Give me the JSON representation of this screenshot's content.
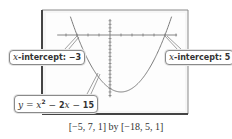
{
  "chart_data": {
    "type": "line",
    "title": "",
    "function": "y = x^2 - 2x - 15",
    "series": [
      {
        "name": "y = x² − 2x − 15",
        "x": [
          -5,
          -4,
          -3,
          -2,
          -1,
          0,
          1,
          2,
          3,
          4,
          5,
          6,
          7
        ],
        "y": [
          20,
          9,
          0,
          -7,
          -12,
          -15,
          -16,
          -15,
          -12,
          -7,
          0,
          9,
          20
        ]
      }
    ],
    "xlim": [
      -5,
      7
    ],
    "ylim": [
      -18,
      5
    ],
    "xscale": 1,
    "yscale": 1,
    "grid": false,
    "annotations": [
      {
        "text": "x-intercept: −3",
        "x": -3,
        "y": 0
      },
      {
        "text": "x-intercept: 5",
        "x": 5,
        "y": 0
      },
      {
        "text": "y = x² − 2x − 15",
        "target": "curve"
      }
    ],
    "xlabel": "",
    "ylabel": ""
  },
  "labels": {
    "left_intercept_var": "x",
    "left_intercept_text": "-intercept: ",
    "left_intercept_value": "−3",
    "right_intercept_var": "x",
    "right_intercept_text": "-intercept: ",
    "right_intercept_value": "5",
    "equation_y": "y",
    "equation_eq": " = ",
    "equation_x": "x",
    "equation_exp": "2",
    "equation_rest1": " − ",
    "equation_2x": "2",
    "equation_x2": "x",
    "equation_rest2": " − ",
    "equation_const": "15"
  },
  "caption": "[−5, 7, 1] by [−18, 5, 1]",
  "colors": {
    "frame": "#555555",
    "curve": "#7a7a7a",
    "axis": "#777777",
    "plot_bg": "#fcfcfc"
  }
}
